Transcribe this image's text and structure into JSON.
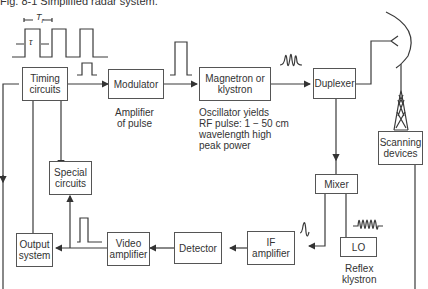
{
  "figure": {
    "title": "Fig. 8-1   Simplified radar system.",
    "symbols": {
      "period": "T",
      "period_sub": "r",
      "pulse_width": "τ"
    }
  },
  "blocks": {
    "timing": "Timing circuits",
    "modulator": "Modulator",
    "magnetron": "Magnetron or klystron",
    "duplexer": "Duplexer",
    "scanning": "Scanning devices",
    "mixer": "Mixer",
    "lo": "LO",
    "if_amp": "IF amplifier",
    "detector": "Detector",
    "video_amp": "Video amplifier",
    "output": "Output system",
    "special": "Special circuits"
  },
  "annotations": {
    "modulator_note_1": "Amplifier",
    "modulator_note_2": "of pulse",
    "osc_1": "Oscillator yields",
    "osc_2": "RF pulse:  1 − 50 cm",
    "osc_3": "wavelength high",
    "osc_4": "peak power",
    "lo_note_1": "Reflex",
    "lo_note_2": "klystron"
  },
  "colors": {
    "line": "#3a3a3a",
    "text": "#333333",
    "background": "#ffffff"
  }
}
